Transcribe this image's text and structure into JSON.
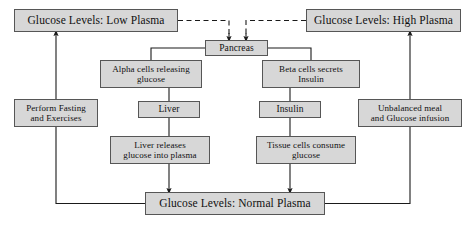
{
  "diagram": {
    "type": "flowchart",
    "colors": {
      "node_fill": "#d7d7d7",
      "node_border": "#565656",
      "edge": "#1a1a1a",
      "text": "#101010",
      "background": "#ffffff"
    },
    "nodes": [
      {
        "id": "low_plasma",
        "label": "Glucose Levels: Low Plasma"
      },
      {
        "id": "high_plasma",
        "label": "Glucose Levels: High Plasma"
      },
      {
        "id": "pancreas",
        "label": "Pancreas"
      },
      {
        "id": "alpha_cells",
        "label": "Alpha cells releasing\nglucose"
      },
      {
        "id": "beta_cells",
        "label": "Beta cells secrets\nInsulin"
      },
      {
        "id": "fasting",
        "label": "Perform Fasting\nand Exercises"
      },
      {
        "id": "unbalanced",
        "label": "Unbalanced meal\nand Glucose infusion"
      },
      {
        "id": "liver",
        "label": "Liver"
      },
      {
        "id": "insulin",
        "label": "Insulin"
      },
      {
        "id": "liver_release",
        "label": "Liver releases\nglucose into plasma"
      },
      {
        "id": "tissue_cells",
        "label": "Tissue cells consume\nglucose"
      },
      {
        "id": "normal_plasma",
        "label": "Glucose Levels: Normal Plasma"
      }
    ],
    "edges": [
      {
        "from": "low_plasma",
        "to": "pancreas",
        "style": "dashed",
        "arrow": true
      },
      {
        "from": "high_plasma",
        "to": "pancreas",
        "style": "dashed",
        "arrow": true
      },
      {
        "from": "pancreas",
        "to": "alpha_cells",
        "style": "solid",
        "arrow": false
      },
      {
        "from": "pancreas",
        "to": "beta_cells",
        "style": "solid",
        "arrow": false
      },
      {
        "from": "alpha_cells",
        "to": "liver",
        "style": "solid",
        "arrow": false
      },
      {
        "from": "beta_cells",
        "to": "insulin",
        "style": "solid",
        "arrow": false
      },
      {
        "from": "liver",
        "to": "liver_release",
        "style": "solid",
        "arrow": false
      },
      {
        "from": "insulin",
        "to": "tissue_cells",
        "style": "solid",
        "arrow": false
      },
      {
        "from": "liver_release",
        "to": "normal_plasma",
        "style": "solid",
        "arrow": true
      },
      {
        "from": "tissue_cells",
        "to": "normal_plasma",
        "style": "solid",
        "arrow": true
      },
      {
        "from": "normal_plasma",
        "to": "fasting",
        "style": "solid",
        "arrow": false
      },
      {
        "from": "normal_plasma",
        "to": "unbalanced",
        "style": "solid",
        "arrow": false
      },
      {
        "from": "fasting",
        "to": "low_plasma",
        "style": "solid",
        "arrow": true
      },
      {
        "from": "unbalanced",
        "to": "high_plasma",
        "style": "solid",
        "arrow": true
      }
    ]
  }
}
